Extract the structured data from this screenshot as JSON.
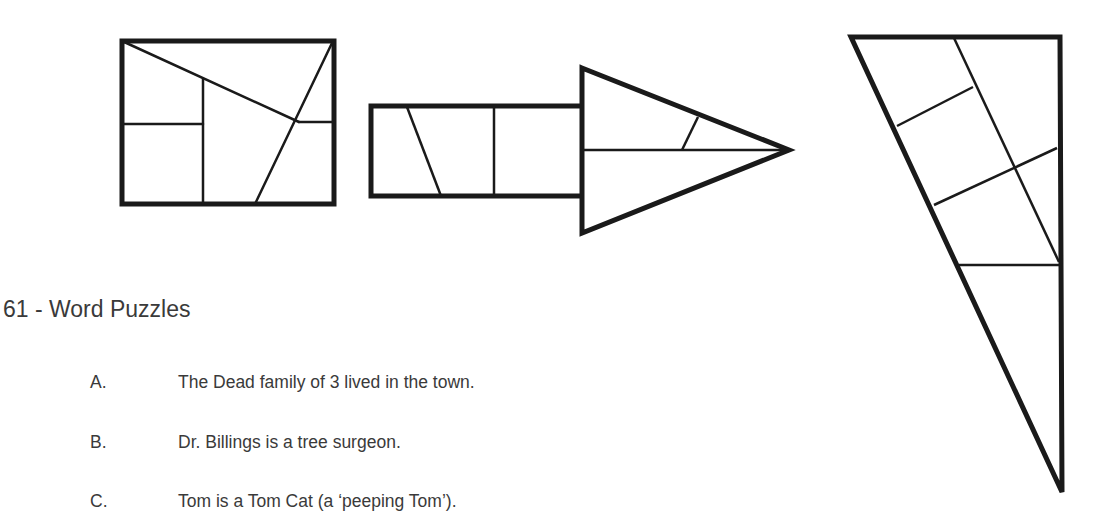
{
  "section": {
    "heading": "61 - Word Puzzles",
    "items": [
      {
        "letter": "A.",
        "text": "The Dead family of 3 lived in the town."
      },
      {
        "letter": "B.",
        "text": "Dr. Billings is a tree surgeon."
      },
      {
        "letter": "C.",
        "text": "Tom is a Tom Cat (a ‘peeping Tom’)."
      }
    ]
  },
  "figures": [
    {
      "name": "rectangle-dissection",
      "description": "Rectangle divided into pieces"
    },
    {
      "name": "arrow-dissection",
      "description": "Arrow shape composed of the same pieces"
    },
    {
      "name": "triangle-dissection",
      "description": "Right triangle composed of the same pieces"
    }
  ],
  "colors": {
    "stroke": "#1a1a1a",
    "text": "#3a3a3a",
    "background": "#ffffff"
  }
}
